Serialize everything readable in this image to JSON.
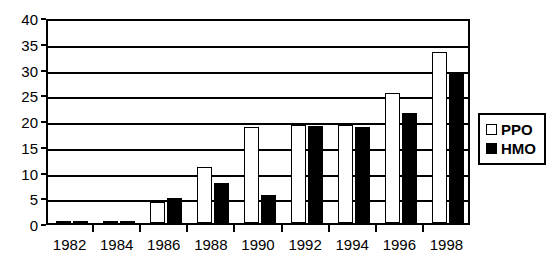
{
  "chart_data": {
    "type": "bar",
    "title": "",
    "xlabel": "",
    "ylabel": "",
    "categories": [
      "1982",
      "1984",
      "1986",
      "1988",
      "1990",
      "1992",
      "1994",
      "1996",
      "1998"
    ],
    "series": [
      {
        "name": "PPO",
        "color": "#ffffff",
        "values": [
          0.2,
          0.4,
          4.0,
          10.8,
          18.7,
          19.0,
          19.0,
          25.2,
          33.2
        ]
      },
      {
        "name": "HMO",
        "color": "#000000",
        "values": [
          0.2,
          0.4,
          4.8,
          7.7,
          5.5,
          18.8,
          18.6,
          21.3,
          29.2
        ]
      }
    ],
    "ylim": [
      0,
      40
    ],
    "ytick_step": 5,
    "yticks": [
      "0",
      "5",
      "10",
      "15",
      "20",
      "25",
      "30",
      "35",
      "40"
    ],
    "grid": true,
    "grid_axis": "y",
    "legend_position": "right"
  },
  "legend": {
    "entries": [
      {
        "label": "PPO",
        "swatch": "hollow-square-icon"
      },
      {
        "label": "HMO",
        "swatch": "filled-square-icon"
      }
    ]
  }
}
